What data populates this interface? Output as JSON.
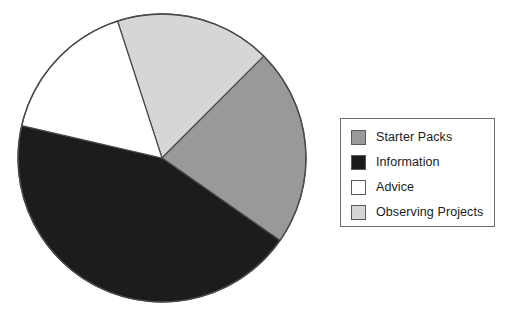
{
  "chart_data": {
    "type": "pie",
    "title": "",
    "subtitle": "",
    "xlabel": "",
    "ylabel": "",
    "grid": false,
    "legend_position": "right",
    "start_angle_deg": 342,
    "direction": "clockwise",
    "categories": [
      "Starter Packs",
      "Information",
      "Advice",
      "Observing Projects"
    ],
    "values": [
      80,
      158,
      59,
      63
    ],
    "units": "degrees",
    "percentages": [
      22.2,
      43.9,
      16.4,
      17.5
    ],
    "colors": [
      "#999999",
      "#1c1c1c",
      "#ffffff",
      "#d6d6d6"
    ],
    "slices": [
      {
        "label": "Observing Projects",
        "color": "#d6d6d6",
        "start_deg": 342,
        "end_deg": 405,
        "sweep_deg": 63,
        "percent": 17.5
      },
      {
        "label": "Starter Packs",
        "color": "#999999",
        "start_deg": 45,
        "end_deg": 125,
        "sweep_deg": 80,
        "percent": 22.2
      },
      {
        "label": "Information",
        "color": "#1c1c1c",
        "start_deg": 125,
        "end_deg": 283,
        "sweep_deg": 158,
        "percent": 43.9
      },
      {
        "label": "Advice",
        "color": "#ffffff",
        "start_deg": 283,
        "end_deg": 342,
        "sweep_deg": 59,
        "percent": 16.4
      }
    ],
    "geometry": {
      "center_x": 162,
      "center_y": 158,
      "radius": 144,
      "outline_color": "#4a4a4a"
    }
  },
  "legend": {
    "border_color": "#6e6e6e",
    "background": "#ffffff",
    "items": [
      {
        "label": "Starter Packs",
        "swatch_color": "#999999"
      },
      {
        "label": "Information",
        "swatch_color": "#1c1c1c"
      },
      {
        "label": "Advice",
        "swatch_color": "#ffffff"
      },
      {
        "label": "Observing Projects",
        "swatch_color": "#d6d6d6"
      }
    ]
  }
}
